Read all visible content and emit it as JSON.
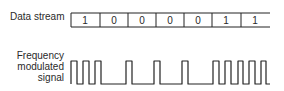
{
  "labels": {
    "data_stream": "Data stream",
    "fm_line1": "Frequency",
    "fm_line2": "modulated",
    "fm_line3": "signal"
  },
  "data_stream": {
    "bits": [
      "1",
      "0",
      "0",
      "0",
      "0",
      "1",
      "1"
    ],
    "right_end_open": true
  },
  "signal": {
    "type": "frequency-modulated square wave",
    "encoding": "bit 1 = high frequency (multiple short pulses), bit 0 = low frequency (one wide pulse per two bits)",
    "line_color": "#222222"
  },
  "colors": {
    "background": "#ffffff",
    "line": "#222222",
    "text": "#2a2a2a"
  }
}
